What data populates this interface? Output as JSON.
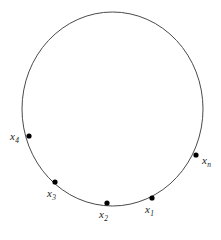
{
  "figure": {
    "type": "geometric-diagram",
    "background_color": "#ffffff",
    "stroke_color": "#4a4a4a",
    "point_color": "#000000",
    "label_color": "#1a1a1a",
    "circle": {
      "center_x": 112.5,
      "center_y": 109,
      "radius_x": 90.5,
      "radius_y": 97,
      "stroke_width": 1
    },
    "points": [
      {
        "id": "x4",
        "symbol": "x",
        "subscript": "4",
        "cx": 29,
        "cy": 136,
        "r": 2.6,
        "label_position": "left"
      },
      {
        "id": "x3",
        "symbol": "x",
        "subscript": "3",
        "cx": 55,
        "cy": 182,
        "r": 2.6,
        "label_position": "below"
      },
      {
        "id": "x2",
        "symbol": "x",
        "subscript": "2",
        "cx": 107,
        "cy": 203,
        "r": 2.6,
        "label_position": "below"
      },
      {
        "id": "x1",
        "symbol": "x",
        "subscript": "1",
        "cx": 152,
        "cy": 198,
        "r": 2.6,
        "label_position": "below"
      },
      {
        "id": "xn",
        "symbol": "x",
        "subscript": "n",
        "cx": 196,
        "cy": 155,
        "r": 2.6,
        "label_position": "right"
      }
    ]
  }
}
